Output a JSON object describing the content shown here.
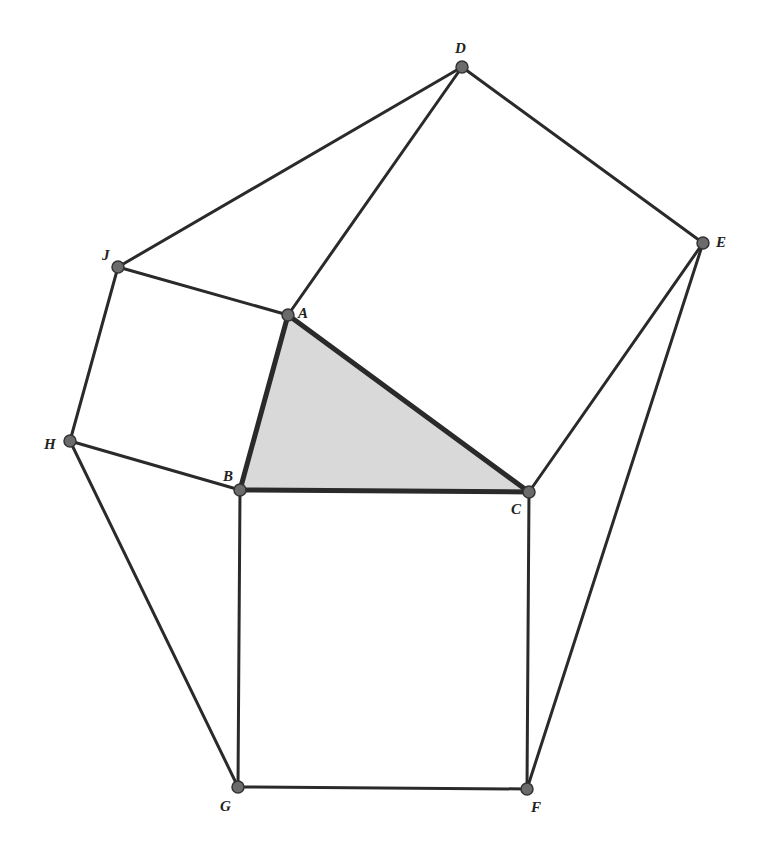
{
  "diagram": {
    "type": "geometry",
    "colors": {
      "line": "#2a2a2a",
      "point": "#6b6b6b",
      "triangle_fill": "#d9d9d9",
      "background": "#ffffff"
    },
    "points": {
      "A": {
        "label": "A",
        "x": 288,
        "y": 315
      },
      "B": {
        "label": "B",
        "x": 240,
        "y": 490
      },
      "C": {
        "label": "C",
        "x": 529,
        "y": 492
      },
      "D": {
        "label": "D",
        "x": 462,
        "y": 67
      },
      "E": {
        "label": "E",
        "x": 703,
        "y": 243
      },
      "F": {
        "label": "F",
        "x": 527,
        "y": 789
      },
      "G": {
        "label": "G",
        "x": 238,
        "y": 787
      },
      "H": {
        "label": "H",
        "x": 70,
        "y": 441
      },
      "J": {
        "label": "J",
        "x": 118,
        "y": 267
      }
    },
    "shaded_triangle": [
      "A",
      "B",
      "C"
    ],
    "squares": [
      [
        "A",
        "D",
        "E",
        "C"
      ],
      [
        "A",
        "J",
        "H",
        "B"
      ],
      [
        "B",
        "C",
        "F",
        "G"
      ]
    ],
    "outer_triangles": [
      [
        "A",
        "J",
        "D"
      ],
      [
        "C",
        "E",
        "F"
      ],
      [
        "B",
        "H",
        "G"
      ]
    ]
  }
}
